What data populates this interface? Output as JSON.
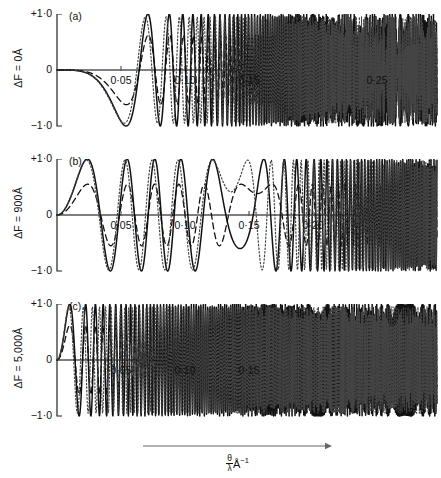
{
  "figure": {
    "background_color": "#ffffff",
    "ink_color": "#111111",
    "axis_color": "#555555",
    "width": 441,
    "height": 478
  },
  "xaxis_caption": {
    "numerator": "θ",
    "denominator": "λ",
    "unit": "Å",
    "exponent": "−1"
  },
  "chart_data": {
    "type": "line",
    "title": "",
    "xlabel": "θ/λ Å⁻¹",
    "ylabel": "Contrast transfer",
    "grid": false,
    "legend_position": "none",
    "xlim": [
      0,
      0.29
    ],
    "ylim": [
      -1.0,
      1.0
    ],
    "shared_x_ticks": [
      0.05,
      0.1,
      0.15,
      0.2,
      0.25
    ],
    "shared_y_ticks": [
      1.0,
      0,
      -1.0
    ],
    "shared_y_tick_labels": [
      "+1·0",
      "0",
      "−1·0"
    ],
    "series_styles": [
      "solid",
      "dashed",
      "dotted"
    ],
    "panels": [
      {
        "tag": "(a)",
        "ylabel": "ΔF = 0Å",
        "defocus_angstrom": 0,
        "x_tick_labels": [
          "0·05",
          "0·10",
          "0·15",
          "0·25"
        ],
        "x_tick_values": [
          0.05,
          0.1,
          0.15,
          0.25
        ],
        "x_tick_all": [
          0.05,
          0.1,
          0.15,
          0.2,
          0.25
        ],
        "series": [
          {
            "name": "solid",
            "style": "solid",
            "k_defocus": 0,
            "k_spherical": 118000,
            "envelope": 1.0,
            "phase_shift": 0
          },
          {
            "name": "dashed",
            "style": "dashed",
            "k_defocus": 0,
            "k_spherical": 116000,
            "envelope": 0.62,
            "phase_shift": 0
          },
          {
            "name": "dotted",
            "style": "dotted",
            "k_defocus": 0,
            "k_spherical": 132000,
            "envelope": 0.95,
            "phase_shift": 0
          }
        ]
      },
      {
        "tag": "(b)",
        "ylabel": "ΔF = 900Å",
        "defocus_angstrom": 900,
        "x_tick_labels": [
          "0·05",
          "0·10",
          "0·15",
          "0·20"
        ],
        "x_tick_values": [
          0.05,
          0.1,
          0.15,
          0.2
        ],
        "x_tick_all": [
          0.05,
          0.1,
          0.15,
          0.2,
          0.25
        ],
        "series": [
          {
            "name": "solid",
            "style": "solid",
            "k_defocus": 900,
            "k_spherical": 44000,
            "envelope": 1.0,
            "phase_shift": 0
          },
          {
            "name": "dashed",
            "style": "dashed",
            "k_defocus": 880,
            "k_spherical": 36000,
            "envelope": 0.55,
            "phase_shift": 0
          },
          {
            "name": "dotted",
            "style": "dotted",
            "k_defocus": 960,
            "k_spherical": 52000,
            "envelope": 0.98,
            "phase_shift": 0
          }
        ]
      },
      {
        "tag": "(c)",
        "ylabel": "ΔF = 5,000Å",
        "defocus_angstrom": 5000,
        "x_tick_labels": [
          "0·05",
          "0·10",
          "0·15"
        ],
        "x_tick_values": [
          0.05,
          0.1,
          0.15
        ],
        "x_tick_all": [
          0.05,
          0.1,
          0.15,
          0.2,
          0.25
        ],
        "series": [
          {
            "name": "solid",
            "style": "solid",
            "k_defocus": 5000,
            "k_spherical": 9000,
            "envelope": 1.0,
            "phase_shift": 0
          },
          {
            "name": "dashed",
            "style": "dashed",
            "k_defocus": 5000,
            "k_spherical": 9000,
            "envelope": 0.62,
            "phase_shift": 0
          },
          {
            "name": "dotted",
            "style": "dotted",
            "k_defocus": 5900,
            "k_spherical": 11000,
            "envelope": 0.95,
            "phase_shift": 0
          }
        ]
      }
    ]
  },
  "geometry": {
    "panel_tops": [
      14,
      159,
      304
    ],
    "plot_height": 112,
    "axis_x_left": 57,
    "axis_x_right": 437,
    "x_pixels_per_unit": 1280,
    "x_origin_px": 57,
    "arrow": {
      "x1": 143,
      "x2": 332,
      "y": 446
    }
  }
}
